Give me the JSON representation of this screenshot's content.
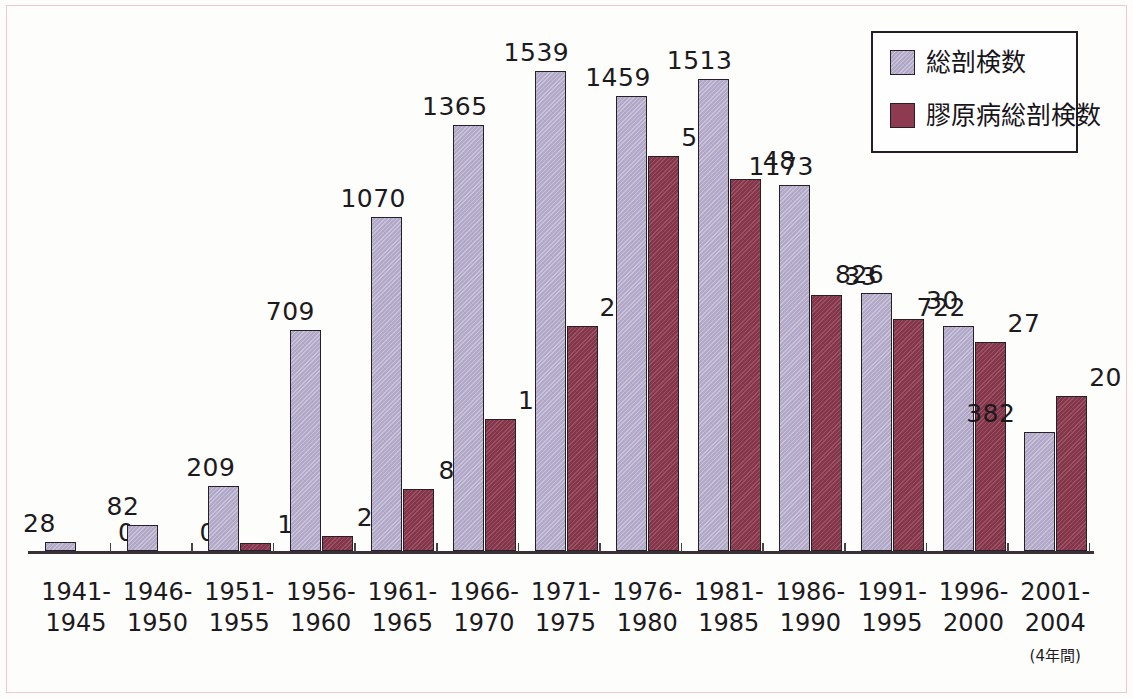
{
  "chart_data": {
    "type": "bar",
    "title": "",
    "subtitle": "",
    "xlabel": "",
    "ylabel": "",
    "grid": false,
    "legend_position": "top-right",
    "categories": [
      "1941-\n1945",
      "1946-\n1950",
      "1951-\n1955",
      "1956-\n1960",
      "1961-\n1965",
      "1966-\n1970",
      "1971-\n1975",
      "1976-\n1980",
      "1981-\n1985",
      "1986-\n1990",
      "1991-\n1995",
      "1996-\n2000",
      "2001-\n2004"
    ],
    "category_lines": [
      [
        "1941-",
        "1945"
      ],
      [
        "1946-",
        "1950"
      ],
      [
        "1951-",
        "1955"
      ],
      [
        "1956-",
        "1960"
      ],
      [
        "1961-",
        "1965"
      ],
      [
        "1966-",
        "1970"
      ],
      [
        "1971-",
        "1975"
      ],
      [
        "1976-",
        "1980"
      ],
      [
        "1981-",
        "1985"
      ],
      [
        "1986-",
        "1990"
      ],
      [
        "1991-",
        "1995"
      ],
      [
        "1996-",
        "2000"
      ],
      [
        "2001-",
        "2004"
      ]
    ],
    "category_note_index": 12,
    "category_note": "(4年間)",
    "series": [
      {
        "name": "総剖検数",
        "color": "#b2a9c9",
        "axis": "left",
        "values": [
          28,
          82,
          209,
          709,
          1070,
          1365,
          1539,
          1459,
          1513,
          1173,
          826,
          722,
          382
        ],
        "labels": [
          "28",
          "82",
          "209",
          "709",
          "1070",
          "1365",
          "1539",
          "1459",
          "1513",
          "1173",
          "826",
          "722",
          "382"
        ]
      },
      {
        "name": "膠原病総剖検数",
        "color": "#8e3a50",
        "axis": "right",
        "values": [
          0,
          0,
          1,
          2,
          8,
          17,
          29,
          51,
          48,
          33,
          30,
          27,
          20
        ],
        "labels": [
          "0",
          "0",
          "1",
          "2",
          "8",
          "17",
          "29",
          "51",
          "48",
          "33",
          "30",
          "27",
          "20"
        ]
      }
    ],
    "ylim_left": [
      0,
      1769
    ],
    "ylim_right": [
      0,
      71
    ]
  },
  "legend": {
    "items": [
      {
        "label": "総剖検数",
        "color": "#b2a9c9"
      },
      {
        "label": "膠原病総剖検数",
        "color": "#8e3a50"
      }
    ]
  },
  "colors": {
    "total_bar": "#b2a9c9",
    "collagen_bar": "#8e3a50",
    "bar_outline": "#272026",
    "axis": "#3a3038",
    "text": "#1d1a1e",
    "frame": "#f0c8cf",
    "background": "#fdfdfc"
  },
  "layout": {
    "baseline_y": 551,
    "axis_left": 28,
    "axis_right": 1094,
    "group_start_x": 45,
    "group_pitch": 81.6,
    "bar_width": 31,
    "scale_left_px_per_unit": 0.3119,
    "scale_right_px_per_unit": 7.75
  }
}
